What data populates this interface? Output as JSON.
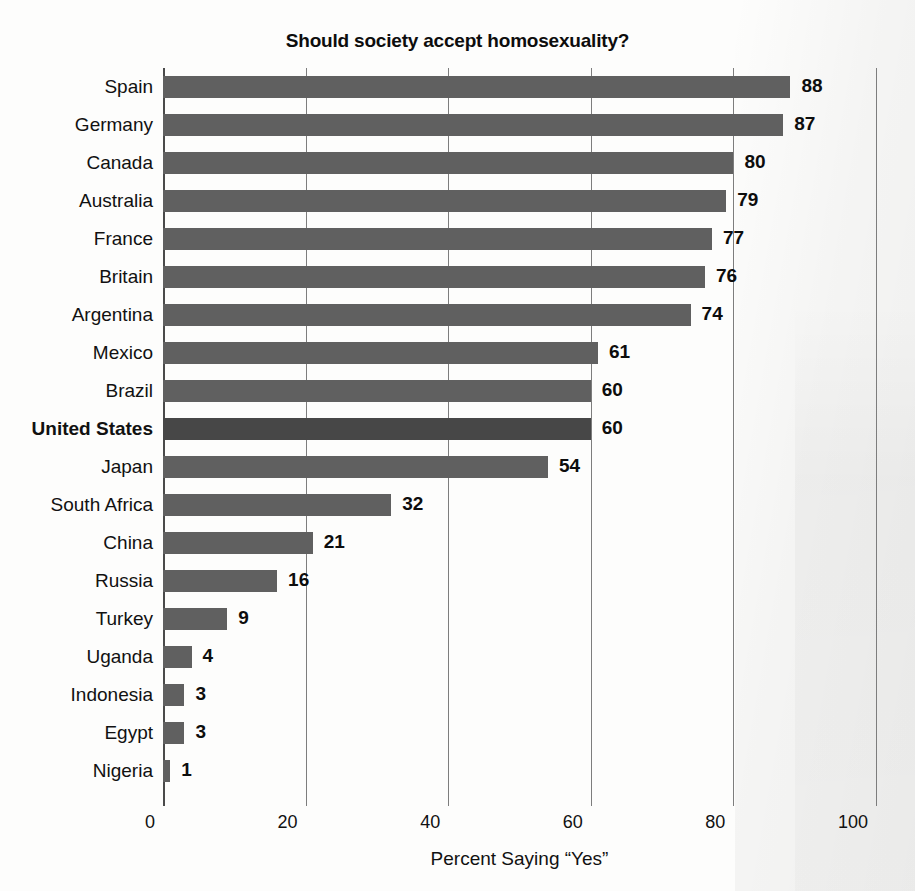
{
  "chart_data": {
    "type": "bar",
    "orientation": "horizontal",
    "title": "Should society accept homosexuality?",
    "xlabel": "Percent Saying “Yes”",
    "ylabel": "",
    "xlim": [
      0,
      100
    ],
    "xticks": [
      0,
      20,
      40,
      60,
      80,
      100
    ],
    "xtick_labels": [
      "0",
      "20",
      "40",
      "60",
      "80",
      "100"
    ],
    "grid": "vertical",
    "legend": "none",
    "value_labels": true,
    "highlight_category": "United States",
    "colors": {
      "bar": "#606060",
      "bar_highlight": "#474747",
      "background": "#fdfdfc",
      "text": "#111111",
      "gridline": "#7d7d7d",
      "axis": "#4a4a4a"
    },
    "categories": [
      "Spain",
      "Germany",
      "Canada",
      "Australia",
      "France",
      "Britain",
      "Argentina",
      "Mexico",
      "Brazil",
      "United States",
      "Japan",
      "South Africa",
      "China",
      "Russia",
      "Turkey",
      "Uganda",
      "Indonesia",
      "Egypt",
      "Nigeria"
    ],
    "values": [
      88,
      87,
      80,
      79,
      77,
      76,
      74,
      61,
      60,
      60,
      54,
      32,
      21,
      16,
      9,
      4,
      3,
      3,
      1
    ],
    "value_label_text": [
      "88",
      "87",
      "80",
      "79",
      "77",
      "76",
      "74",
      "61",
      "60",
      "60",
      "54",
      "32",
      "21",
      "16",
      "9",
      "4",
      "3",
      "3",
      "1"
    ],
    "bars": [
      {
        "category": "Spain",
        "value": 88,
        "label": "88",
        "bold_category": false
      },
      {
        "category": "Germany",
        "value": 87,
        "label": "87",
        "bold_category": false
      },
      {
        "category": "Canada",
        "value": 80,
        "label": "80",
        "bold_category": false
      },
      {
        "category": "Australia",
        "value": 79,
        "label": "79",
        "bold_category": false
      },
      {
        "category": "France",
        "value": 77,
        "label": "77",
        "bold_category": false
      },
      {
        "category": "Britain",
        "value": 76,
        "label": "76",
        "bold_category": false
      },
      {
        "category": "Argentina",
        "value": 74,
        "label": "74",
        "bold_category": false
      },
      {
        "category": "Mexico",
        "value": 61,
        "label": "61",
        "bold_category": false
      },
      {
        "category": "Brazil",
        "value": 60,
        "label": "60",
        "bold_category": false
      },
      {
        "category": "United States",
        "value": 60,
        "label": "60",
        "bold_category": true
      },
      {
        "category": "Japan",
        "value": 54,
        "label": "54",
        "bold_category": false
      },
      {
        "category": "South Africa",
        "value": 32,
        "label": "32",
        "bold_category": false
      },
      {
        "category": "China",
        "value": 21,
        "label": "21",
        "bold_category": false
      },
      {
        "category": "Russia",
        "value": 16,
        "label": "16",
        "bold_category": false
      },
      {
        "category": "Turkey",
        "value": 9,
        "label": "9",
        "bold_category": false
      },
      {
        "category": "Uganda",
        "value": 4,
        "label": "4",
        "bold_category": false
      },
      {
        "category": "Indonesia",
        "value": 3,
        "label": "3",
        "bold_category": false
      },
      {
        "category": "Egypt",
        "value": 3,
        "label": "3",
        "bold_category": false
      },
      {
        "category": "Nigeria",
        "value": 1,
        "label": "1",
        "bold_category": false
      }
    ]
  }
}
